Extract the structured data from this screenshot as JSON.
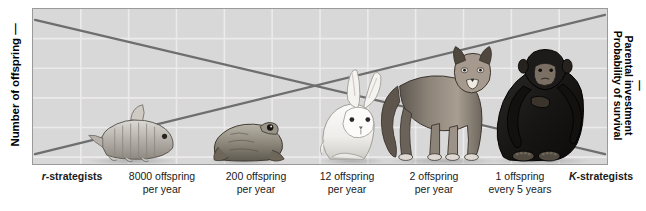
{
  "figure": {
    "axes": {
      "left_label": "Number of offspring",
      "left_dash": "—",
      "right_dash": "—",
      "right_label_line1": "Parental investment",
      "right_label_line2": "Probability of survival"
    },
    "colors": {
      "plot_background": "#d8d8d8",
      "grid_line": "#eceaea",
      "plot_border": "#9a9a9a",
      "trend_line": "#6e6e6e",
      "page_background": "#ffffff",
      "text": "#1a1a1a"
    },
    "grid": {
      "vertical_lines": 12,
      "horizontal_lines": 5
    },
    "trend_lines": [
      {
        "name": "number-of-offspring-line",
        "direction": "descending",
        "start": {
          "x": 0,
          "y": 0.08
        },
        "end": {
          "x": 1,
          "y": 0.93
        }
      },
      {
        "name": "parental-investment-line",
        "direction": "ascending",
        "start": {
          "x": 0,
          "y": 0.93
        },
        "end": {
          "x": 1,
          "y": 0.04
        }
      }
    ],
    "animals": [
      {
        "name": "fish",
        "label": "fish-illustration"
      },
      {
        "name": "frog",
        "label": "frog-illustration"
      },
      {
        "name": "rabbit",
        "label": "rabbit-illustration"
      },
      {
        "name": "cougar",
        "label": "cougar-illustration"
      },
      {
        "name": "chimpanzee",
        "label": "chimpanzee-illustration"
      }
    ],
    "bottom_labels": [
      {
        "prefix_italic": "r",
        "suffix_bold": "-strategists",
        "line1": "",
        "line2": "",
        "bold": true
      },
      {
        "line1": "8000 offspring",
        "line2": "per year",
        "bold": false
      },
      {
        "line1": "200 offspring",
        "line2": "per year",
        "bold": false
      },
      {
        "line1": "12 offspring",
        "line2": "per year",
        "bold": false
      },
      {
        "line1": "2 offspring",
        "line2": "per year",
        "bold": false
      },
      {
        "line1": "1 offspring",
        "line2": "every 5 years",
        "bold": false
      },
      {
        "prefix_italic": "K",
        "suffix_bold": "-strategists",
        "line1": "",
        "line2": "",
        "bold": true
      }
    ]
  }
}
